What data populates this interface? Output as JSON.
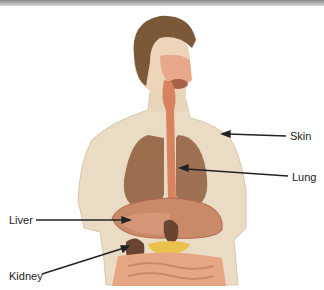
{
  "diagram": {
    "labels": [
      {
        "id": "skin",
        "text": "Skin"
      },
      {
        "id": "lung",
        "text": "Lung"
      },
      {
        "id": "liver",
        "text": "Liver"
      },
      {
        "id": "kidney",
        "text": "Kidney"
      }
    ]
  }
}
